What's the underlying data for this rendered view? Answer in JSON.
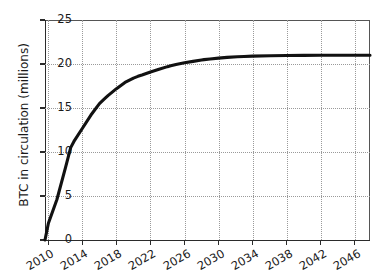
{
  "chart_data": {
    "type": "line",
    "title": "",
    "xlabel": "",
    "ylabel": "BTC in circulation (millions)",
    "xlim": [
      2009.6,
      2047.8
    ],
    "ylim": [
      0,
      25
    ],
    "grid": true,
    "grid_style": "dotted",
    "legend": null,
    "line_color": "#111111",
    "line_width": 3,
    "xticks": [
      2010,
      2014,
      2018,
      2022,
      2026,
      2030,
      2034,
      2038,
      2042,
      2046
    ],
    "xtick_labels": [
      "2010",
      "2014",
      "2018",
      "2022",
      "2026",
      "2030",
      "2034",
      "2038",
      "2042",
      "2046"
    ],
    "xtick_rotation": -30,
    "yticks": [
      0,
      5,
      10,
      15,
      20,
      25
    ],
    "ytick_labels": [
      "0",
      "5",
      "10",
      "15",
      "20",
      "25"
    ],
    "series": [
      {
        "name": "BTC in circulation",
        "x": [
          2009.6,
          2010.0,
          2011.0,
          2012.0,
          2012.62,
          2013.0,
          2014.0,
          2015.0,
          2016.0,
          2016.55,
          2017.0,
          2018.0,
          2019.0,
          2020.0,
          2020.52,
          2021.0,
          2022.0,
          2023.0,
          2024.0,
          2024.37,
          2025.0,
          2026.0,
          2027.0,
          2028.0,
          2028.3,
          2029.0,
          2030.0,
          2031.0,
          2032.2,
          2033.0,
          2034.0,
          2036.1,
          2038.0,
          2040.0,
          2042.0,
          2044.0,
          2046.0,
          2047.8
        ],
        "y": [
          0.0,
          1.9,
          4.6,
          8.2,
          10.5,
          11.2,
          12.7,
          14.2,
          15.5,
          16.0,
          16.4,
          17.2,
          17.9,
          18.4,
          18.6,
          18.75,
          19.1,
          19.4,
          19.7,
          19.8,
          19.95,
          20.15,
          20.3,
          20.45,
          20.5,
          20.57,
          20.67,
          20.75,
          20.82,
          20.86,
          20.89,
          20.94,
          20.96,
          20.98,
          20.99,
          21.0,
          21.0,
          21.0
        ]
      }
    ],
    "annotations": {
      "asymptote": 21,
      "max_supply_label": "21",
      "start_value": 0
    }
  },
  "axes": {
    "ylabel": "BTC in circulation (millions)"
  }
}
